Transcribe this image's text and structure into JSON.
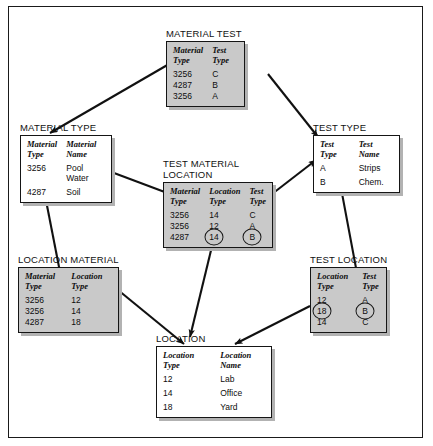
{
  "diagram": {
    "title_hidden": "",
    "tables": [
      {
        "id": "material-test",
        "title": "MATERIAL TEST",
        "style": "gray",
        "columns": [
          "Material\nType",
          "Test\nType"
        ],
        "rows": [
          [
            "3256",
            "C"
          ],
          [
            "4287",
            "B"
          ],
          [
            "3256",
            "A"
          ]
        ]
      },
      {
        "id": "material-type",
        "title": "MATERIAL TYPE",
        "style": "white",
        "columns": [
          "Material\nType",
          "Material\nName"
        ],
        "rows": [
          [
            "3256",
            "Pool\nWater"
          ],
          [
            "4287",
            "Soil"
          ]
        ]
      },
      {
        "id": "test-type",
        "title": "TEST TYPE",
        "style": "white",
        "columns": [
          "Test\nType",
          "Test\nName"
        ],
        "rows": [
          [
            "A",
            "Strips"
          ],
          [
            "B",
            "Chem."
          ]
        ]
      },
      {
        "id": "test-material-location",
        "title": "TEST MATERIAL\nLOCATION",
        "style": "gray",
        "columns": [
          "Material\nType",
          "Location\nType",
          "Test\nType"
        ],
        "rows": [
          [
            "3256",
            "14",
            "C"
          ],
          [
            "3256",
            "12",
            "A"
          ],
          [
            "4287",
            "14",
            "B"
          ]
        ],
        "circled": [
          [
            2,
            1
          ],
          [
            2,
            2
          ]
        ]
      },
      {
        "id": "location-material",
        "title": "LOCATION MATERIAL",
        "style": "gray",
        "columns": [
          "Material\nType",
          "Location\nType"
        ],
        "rows": [
          [
            "3256",
            "12"
          ],
          [
            "3256",
            "14"
          ],
          [
            "4287",
            "18"
          ]
        ]
      },
      {
        "id": "test-location",
        "title": "TEST LOCATION",
        "style": "gray",
        "columns": [
          "Location\nType",
          "Test\nType"
        ],
        "rows": [
          [
            "12",
            "A"
          ],
          [
            "18",
            "B"
          ],
          [
            "14",
            "C"
          ]
        ],
        "circled": [
          [
            1,
            0
          ],
          [
            1,
            1
          ]
        ]
      },
      {
        "id": "location",
        "title": "LOCATION",
        "style": "white",
        "columns": [
          "Location\nType",
          "Location\nName"
        ],
        "rows": [
          [
            "12",
            "Lab"
          ],
          [
            "14",
            "Office"
          ],
          [
            "18",
            "Yard"
          ]
        ]
      }
    ],
    "colors": {
      "table_gray": "#c9c9c9",
      "table_white": "#ffffff",
      "border": "#151515",
      "shadow": "#b2b2b2",
      "arrow": "#111111"
    }
  }
}
